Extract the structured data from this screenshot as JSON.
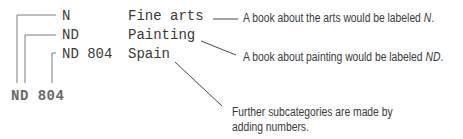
{
  "diagram": {
    "hierarchy": [
      {
        "code": "N",
        "subject": "Fine arts"
      },
      {
        "code": "ND",
        "subject": "Painting"
      },
      {
        "code": "ND 804",
        "subject": "Spain"
      }
    ],
    "call_number": "ND 804",
    "annotations": [
      {
        "prefix": "A book about the arts would be labeled ",
        "emph": "N",
        "suffix": "."
      },
      {
        "prefix": "A book about painting would be labeled ",
        "emph": "ND",
        "suffix": "."
      },
      {
        "line1": "Further subcategories are made by",
        "line2": "adding numbers."
      }
    ],
    "colors": {
      "line": "#6b6b6b",
      "text": "#3a3a3a",
      "call_number": "#6a6a6a"
    }
  }
}
